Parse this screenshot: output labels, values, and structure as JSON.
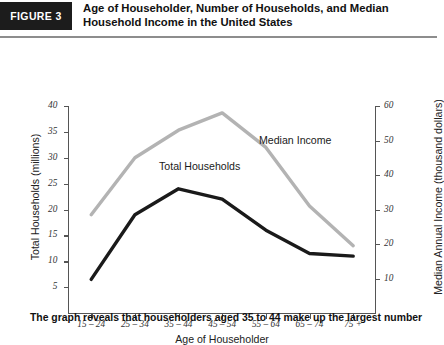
{
  "header": {
    "badge": "FIGURE 3",
    "title": "Age of Householder, Number of Households, and Median Household Income in the United States"
  },
  "caption": "The graph reveals that householders aged 35 to 44 make up the largest number",
  "series_labels": {
    "total_households": "Total Households",
    "median_income": "Median Income"
  },
  "colors": {
    "total_households": "#1a1a1a",
    "median_income": "#b3b3b3",
    "axis": "#555555",
    "badge_bg": "#1c1c1c",
    "badge_text": "#ffffff"
  },
  "chart_data": {
    "type": "line",
    "title": "Age of Householder, Number of Households, and Median Household Income in the United States",
    "xlabel": "Age of Householder",
    "ylabel": "Total Households (millions)",
    "ylabel_right": "Median Annual Income (thousand dollars)",
    "categories": [
      "15 – 24",
      "25 – 34",
      "35 – 44",
      "45 – 54",
      "55 – 64",
      "65 – 74",
      "75 +"
    ],
    "grid": false,
    "legend": "inline-annotations",
    "ylim": [
      0,
      40
    ],
    "yticks": [
      5,
      10,
      15,
      20,
      25,
      30,
      35,
      40
    ],
    "ylim_right": [
      0,
      60
    ],
    "yticks_right": [
      10,
      20,
      30,
      40,
      50,
      60
    ],
    "series": [
      {
        "name": "Total Households",
        "axis": "left",
        "unit": "millions",
        "color": "#1a1a1a",
        "values": [
          6.5,
          19.0,
          24.0,
          22.0,
          16.0,
          11.5,
          11.0
        ]
      },
      {
        "name": "Median Income",
        "axis": "right",
        "unit": "thousand dollars",
        "color": "#b3b3b3",
        "values": [
          28.5,
          45.0,
          53.0,
          58.0,
          48.0,
          31.0,
          19.5
        ]
      }
    ]
  }
}
